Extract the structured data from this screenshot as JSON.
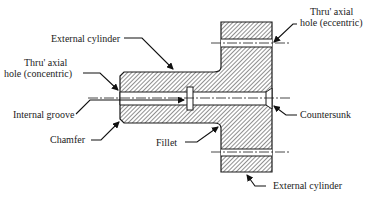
{
  "diagram": {
    "type": "engineering-section",
    "colors": {
      "line": "#1a1a1a",
      "hatch": "#333333",
      "background": "#ffffff",
      "text": "#222222"
    },
    "labels": {
      "external_cylinder_top": "External cylinder",
      "thru_hole_concentric_1": "Thru' axial",
      "thru_hole_concentric_2": "hole (concentric)",
      "internal_groove": "Internal groove",
      "chamfer": "Chamfer",
      "fillet": "Fillet",
      "thru_hole_eccentric_1": "Thru' axial",
      "thru_hole_eccentric_2": "hole (eccentric)",
      "countersunk": "Countersunk",
      "external_cylinder_bottom": "External cylinder"
    },
    "features": [
      "External cylinder (boss)",
      "Thru' axial hole (concentric)",
      "Internal groove",
      "Chamfer",
      "Fillet",
      "Thru' axial hole (eccentric)",
      "Countersunk",
      "External cylinder (flange)"
    ]
  }
}
